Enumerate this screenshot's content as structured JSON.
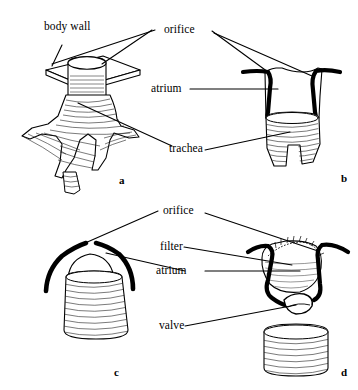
{
  "figure": {
    "background_color": "#ffffff",
    "ink_color": "#000000",
    "hatch_color": "#1a1a1a"
  },
  "labels": {
    "body_wall": "body wall",
    "orifice_top": "orifice",
    "atrium_top": "atrium",
    "trachea": "trachea",
    "orifice_bottom": "orifice",
    "filter": "filter",
    "atrium_bottom": "atrium",
    "valve": "valve"
  },
  "panels": [
    {
      "letter": "a",
      "name": "panel-a",
      "caption": "a"
    },
    {
      "letter": "b",
      "name": "panel-b",
      "caption": "b"
    },
    {
      "letter": "c",
      "name": "panel-c",
      "caption": "c"
    },
    {
      "letter": "d",
      "name": "panel-d",
      "caption": "d"
    }
  ],
  "panel_letters": {
    "a": "a",
    "b": "b",
    "c": "c",
    "d": "d"
  }
}
